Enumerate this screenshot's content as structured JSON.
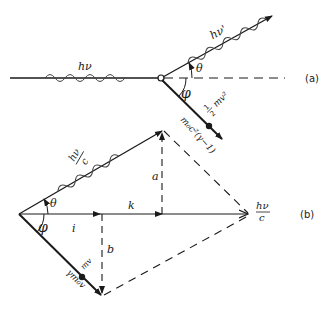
{
  "diagram": {
    "type": "Compton scattering vector diagram",
    "panel_a": {
      "tag": "(a)",
      "incident_photon_label": "hν",
      "scattered_photon_label": "hν'",
      "angle_theta": "θ",
      "angle_phi": "φ",
      "electron_ke_num": "1",
      "electron_ke_den": "2",
      "electron_ke_tail": "mv²",
      "electron_rel_label": "m₀c²(γ−1)"
    },
    "panel_b": {
      "tag": "(b)",
      "scattered_momentum_num": "hν",
      "scattered_momentum_den": "c",
      "incident_momentum_num": "hν",
      "incident_momentum_den": "c",
      "angle_theta": "θ",
      "angle_phi": "φ",
      "segment_i": "i",
      "segment_k": "k",
      "segment_a": "a",
      "segment_b": "b",
      "electron_momentum_label": "mv",
      "electron_rel_momentum_label": "γm₀v"
    }
  },
  "colors": {
    "ink": "#1a1a1a",
    "background": "#ffffff"
  }
}
